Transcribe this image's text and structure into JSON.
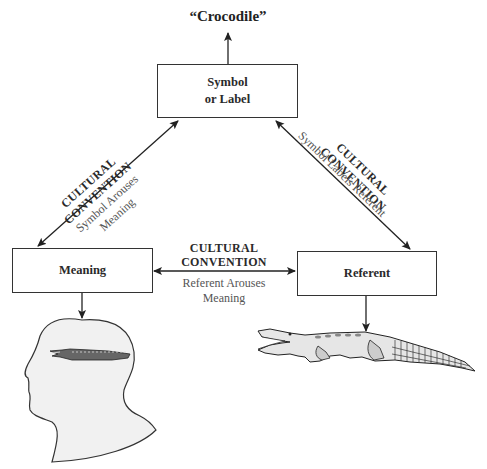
{
  "diagram": {
    "word": "“Crocodile”",
    "nodes": {
      "symbol": {
        "line1": "Symbol",
        "line2": "or Label"
      },
      "meaning": {
        "label": "Meaning"
      },
      "referent": {
        "label": "Referent"
      }
    },
    "edges": {
      "symbol_meaning": {
        "title1": "CULTURAL",
        "title2": "CONVENTION",
        "sub1": "Symbol Arouses",
        "sub2": "Meaning"
      },
      "symbol_referent": {
        "title1": "CULTURAL",
        "title2": "CONVENTION",
        "sub1": "Symbol Labels Referent"
      },
      "meaning_referent": {
        "title1": "CULTURAL",
        "title2": "CONVENTION",
        "sub1": "Referent Arouses",
        "sub2": "Meaning"
      }
    },
    "illustrations": {
      "head": "human-head-with-crocodile-thought",
      "crocodile": "crocodile"
    },
    "colors": {
      "line": "#222222",
      "box_border": "#333333",
      "head_fill": "#f2f2f2"
    }
  }
}
